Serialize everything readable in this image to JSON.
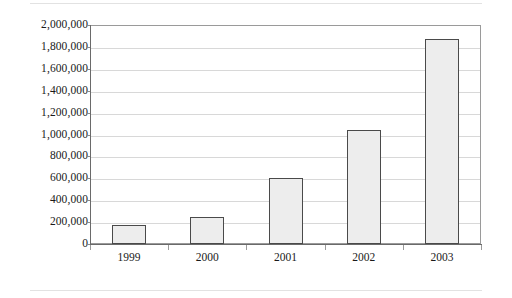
{
  "chart_data": {
    "type": "bar",
    "title": "",
    "subtitle": "",
    "xlabel": "",
    "ylabel": "",
    "categories": [
      "1999",
      "2000",
      "2001",
      "2002",
      "2003"
    ],
    "values": [
      175000,
      250000,
      600000,
      1040000,
      1870000
    ],
    "series": [
      {
        "name": "",
        "values": [
          175000,
          250000,
          600000,
          1040000,
          1870000
        ]
      }
    ],
    "ylim": [
      0,
      2000000
    ],
    "ytick_values": [
      0,
      200000,
      400000,
      600000,
      800000,
      1000000,
      1200000,
      1400000,
      1600000,
      1800000,
      2000000
    ],
    "ytick_labels": [
      "2,000,000",
      "1,800,000",
      "1,600,000",
      "1,400,000",
      "1,200,000",
      "1,000,000",
      "800,000",
      "600,000",
      "400,000",
      "200,000",
      "0"
    ],
    "grid": true,
    "grid_axis": "y",
    "legend": false,
    "legend_position": "none",
    "bar_fill_color": "#ededed",
    "bar_border_color": "#4a4a4a",
    "gridline_color": "#d8d8d8",
    "axis_color": "#6a6a6a",
    "plot_border_color": "#9a9a9a",
    "background_color": "#ffffff",
    "annotations": []
  }
}
